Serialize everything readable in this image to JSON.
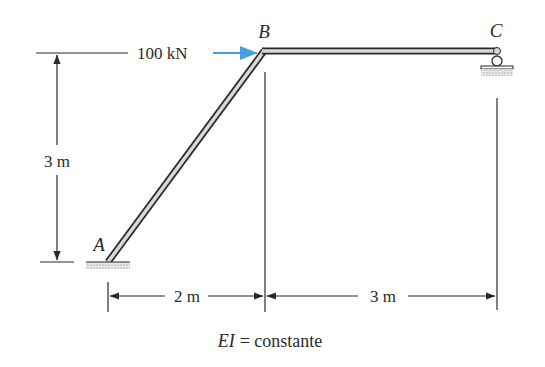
{
  "diagram": {
    "type": "structural-frame",
    "nodes": {
      "A": {
        "label": "A",
        "support": "fixed"
      },
      "B": {
        "label": "B",
        "support": "rigid-joint"
      },
      "C": {
        "label": "C",
        "support": "roller"
      }
    },
    "members": [
      {
        "from": "A",
        "to": "B",
        "kind": "inclined-column"
      },
      {
        "from": "B",
        "to": "C",
        "kind": "horizontal-beam"
      }
    ],
    "load": {
      "label": "100 kN",
      "at": "B",
      "direction": "right",
      "color": "#4a9fd8"
    },
    "dimensions": {
      "vertical": "3 m",
      "horizontal_left": "2 m",
      "horizontal_right": "3 m"
    },
    "note": {
      "ei": "EI",
      "equals": "= constante"
    }
  }
}
